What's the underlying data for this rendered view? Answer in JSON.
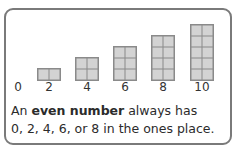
{
  "chart_data": {
    "type": "diagram",
    "title": "",
    "numbers": [
      "0",
      "2",
      "4",
      "6",
      "8",
      "10"
    ],
    "blocks": [
      {
        "number": "0",
        "rows": 0
      },
      {
        "number": "2",
        "rows": 1
      },
      {
        "number": "4",
        "rows": 2
      },
      {
        "number": "6",
        "rows": 3
      },
      {
        "number": "8",
        "rows": 4
      },
      {
        "number": "10",
        "rows": 5
      }
    ],
    "columns_per_block": 2
  },
  "labels": [
    "0",
    "2",
    "4",
    "6",
    "8",
    "10"
  ],
  "caption": {
    "prefix": "An ",
    "bold": "even number",
    "suffix": " always has",
    "line2": "0, 2, 4, 6, or 8 in the ones place."
  },
  "colors": {
    "border": "#7a7a7a",
    "cell_fill": "#d3d3d3",
    "cell_line": "#8a8a8a"
  }
}
